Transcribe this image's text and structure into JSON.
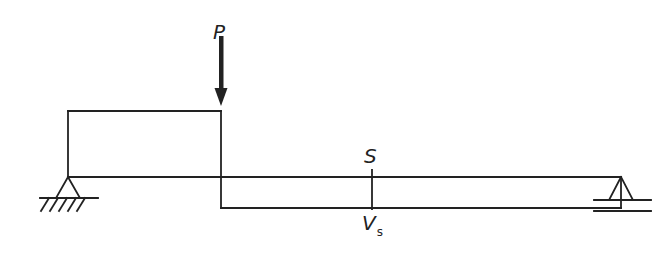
{
  "diagram": {
    "title": "",
    "load": {
      "label": "P",
      "x": 221
    },
    "section": {
      "label": "S"
    },
    "shear": {
      "label": "V",
      "subscript": "s"
    },
    "supports": {
      "left": "pin",
      "right": "roller"
    },
    "colors": {
      "line": "#222222",
      "background": "#ffffff"
    }
  }
}
